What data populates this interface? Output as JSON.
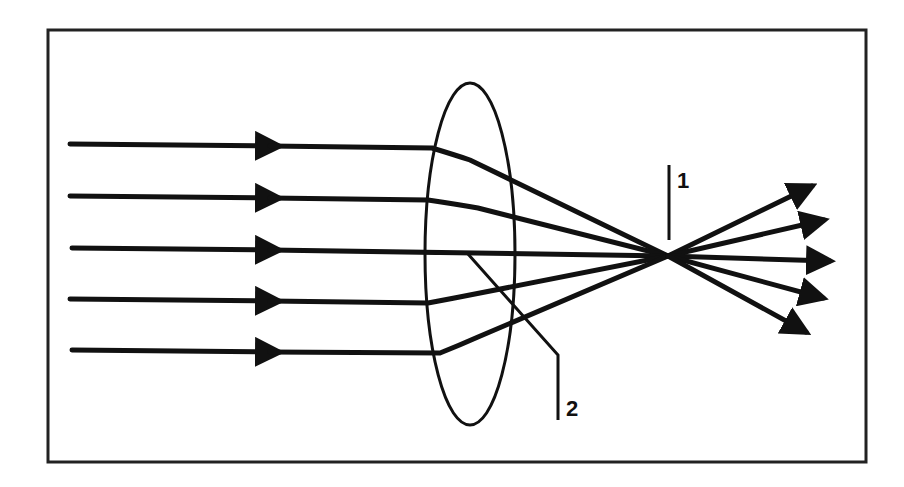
{
  "diagram": {
    "colors": {
      "ink": "#111111",
      "frame": "#222222",
      "background": "#ffffff"
    },
    "frame": {
      "x": 48,
      "y": 30,
      "width": 818,
      "height": 432
    },
    "lens": {
      "type": "convex-lens",
      "cx": 470,
      "cy": 254,
      "rx": 45,
      "ry": 171
    },
    "focal_point": {
      "x": 668,
      "y": 256
    },
    "incoming_rays": [
      {
        "y": 145,
        "lens_x": 432
      },
      {
        "y": 197,
        "lens_x": 428
      },
      {
        "y": 249,
        "lens_x": 425
      },
      {
        "y": 300,
        "lens_x": 428
      },
      {
        "y": 350,
        "lens_x": 440
      }
    ],
    "outgoing_arrow_tips": [
      {
        "x": 818,
        "y": 184
      },
      {
        "x": 830,
        "y": 218
      },
      {
        "x": 836,
        "y": 262
      },
      {
        "x": 829,
        "y": 300
      },
      {
        "x": 812,
        "y": 335
      }
    ],
    "labels": [
      {
        "id": "1",
        "text": "1",
        "meaning": "focal point"
      },
      {
        "id": "2",
        "text": "2",
        "meaning": "lens"
      }
    ]
  }
}
